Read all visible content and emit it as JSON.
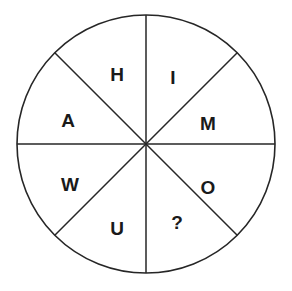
{
  "figure": {
    "name": "letter-wheel",
    "background_color": "#ffffff",
    "stroke_color": "#262626",
    "label_color": "#1a1a1a",
    "circle": {
      "center_x": 146,
      "center_y": 144,
      "radius": 129,
      "stroke_width": 1.6
    },
    "dividers": [
      {
        "name": "vertical-diameter",
        "angle_deg": 90
      },
      {
        "name": "horizontal-diameter",
        "angle_deg": 0
      },
      {
        "name": "diagonal-diameter-nwse",
        "angle_deg": 45
      },
      {
        "name": "diagonal-diameter-nesw",
        "angle_deg": 135
      }
    ],
    "sector_count": 8,
    "sectors": [
      {
        "name": "sector-h",
        "label": "H",
        "x": 117,
        "y": 74
      },
      {
        "name": "sector-i",
        "label": "I",
        "x": 173,
        "y": 77
      },
      {
        "name": "sector-m",
        "label": "M",
        "x": 208,
        "y": 123
      },
      {
        "name": "sector-o",
        "label": "O",
        "x": 208,
        "y": 187
      },
      {
        "name": "sector-question",
        "label": "?",
        "x": 177,
        "y": 222
      },
      {
        "name": "sector-u",
        "label": "U",
        "x": 117,
        "y": 228
      },
      {
        "name": "sector-w",
        "label": "W",
        "x": 70,
        "y": 184
      },
      {
        "name": "sector-a",
        "label": "A",
        "x": 68,
        "y": 120
      }
    ]
  }
}
